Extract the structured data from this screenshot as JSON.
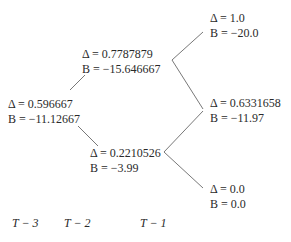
{
  "tree": {
    "nodes": [
      {
        "id": "root",
        "delta": "Δ = 0.596667",
        "b": "B = −11.12667"
      },
      {
        "id": "up",
        "delta": "Δ = 0.7787879",
        "b": "B = −15.646667"
      },
      {
        "id": "down",
        "delta": "Δ = 0.2210526",
        "b": "B = −3.99"
      },
      {
        "id": "uu",
        "delta": "Δ = 1.0",
        "b": "B = −20.0"
      },
      {
        "id": "ud",
        "delta": "Δ = 0.6331658",
        "b": "B = −11.97"
      },
      {
        "id": "dd",
        "delta": "Δ = 0.0",
        "b": "B = 0.0"
      }
    ],
    "time_labels": [
      "T − 3",
      "T − 2",
      "T − 1"
    ],
    "line_color": "#555555"
  }
}
